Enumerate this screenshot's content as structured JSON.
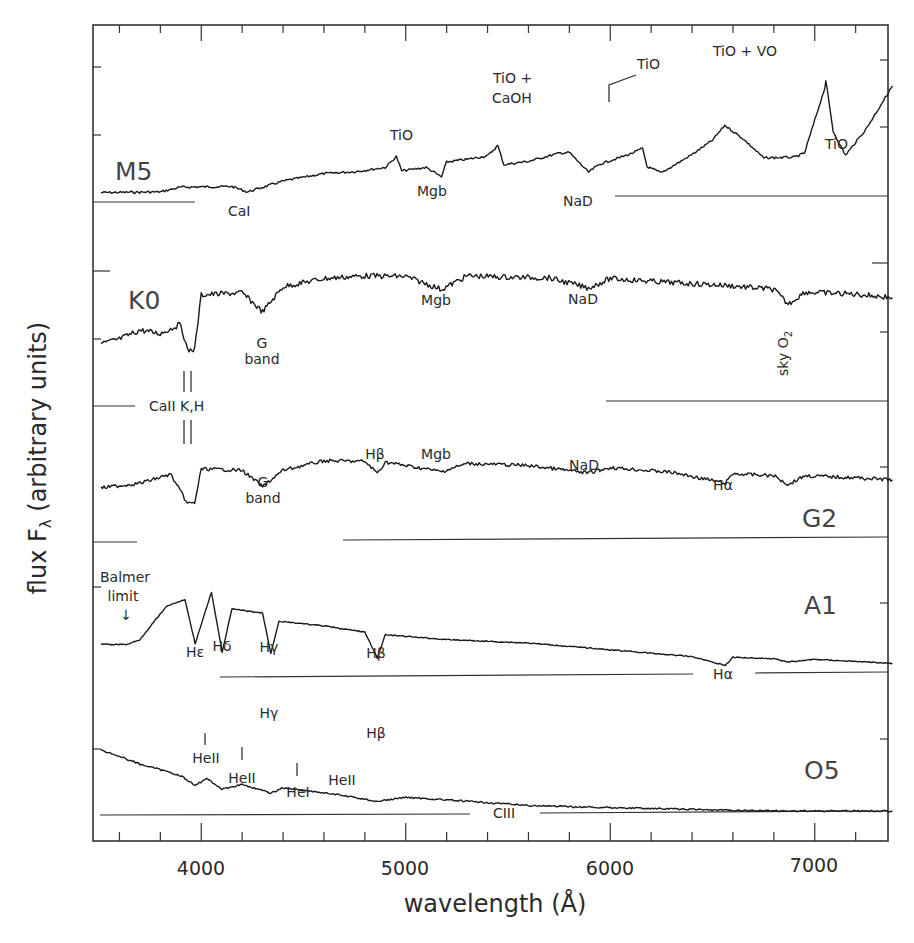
{
  "chart_data": {
    "type": "line",
    "title": "",
    "xlabel": "wavelength (Å)",
    "ylabel": "flux F_λ (arbitrary units)",
    "xlim": [
      3500,
      7380
    ],
    "x_ticks": [
      4000,
      5000,
      6000,
      7000
    ],
    "x_tick_labels": [
      "4000",
      "5000",
      "6000",
      "7000"
    ],
    "x_minor_tick_step": 200,
    "grid": false,
    "legend": "none (spectral types labelled inline)",
    "series": [
      {
        "name": "M5",
        "description": "Flux rises steeply to red; strong TiO/VO molecular bands",
        "points": [
          [
            3510,
            0.05
          ],
          [
            3800,
            0.06
          ],
          [
            3900,
            0.13
          ],
          [
            4150,
            0.14
          ],
          [
            4226,
            0.06
          ],
          [
            4400,
            0.22
          ],
          [
            4600,
            0.33
          ],
          [
            4760,
            0.36
          ],
          [
            4900,
            0.42
          ],
          [
            4954,
            0.58
          ],
          [
            4980,
            0.37
          ],
          [
            5100,
            0.42
          ],
          [
            5175,
            0.28
          ],
          [
            5200,
            0.5
          ],
          [
            5300,
            0.54
          ],
          [
            5400,
            0.59
          ],
          [
            5450,
            0.74
          ],
          [
            5480,
            0.46
          ],
          [
            5600,
            0.51
          ],
          [
            5750,
            0.63
          ],
          [
            5800,
            0.64
          ],
          [
            5893,
            0.35
          ],
          [
            5950,
            0.47
          ],
          [
            6100,
            0.62
          ],
          [
            6158,
            0.7
          ],
          [
            6180,
            0.43
          ],
          [
            6250,
            0.34
          ],
          [
            6400,
            0.61
          ],
          [
            6500,
            0.82
          ],
          [
            6560,
            1.04
          ],
          [
            6650,
            0.84
          ],
          [
            6750,
            0.56
          ],
          [
            6900,
            0.57
          ],
          [
            6950,
            0.63
          ],
          [
            7050,
            1.6
          ],
          [
            7054,
            1.7
          ],
          [
            7090,
            0.95
          ],
          [
            7150,
            0.6
          ],
          [
            7250,
            0.98
          ],
          [
            7380,
            1.62
          ]
        ]
      },
      {
        "name": "K0",
        "description": "Strong CaII K,H and G band; Mgb, NaD, telluric O2",
        "points": [
          [
            3510,
            0.9
          ],
          [
            3600,
            0.97
          ],
          [
            3700,
            1.1
          ],
          [
            3800,
            1.05
          ],
          [
            3900,
            1.19
          ],
          [
            3933,
            0.8
          ],
          [
            3968,
            0.82
          ],
          [
            4000,
            1.62
          ],
          [
            4200,
            1.65
          ],
          [
            4300,
            1.37
          ],
          [
            4400,
            1.74
          ],
          [
            4600,
            1.86
          ],
          [
            4800,
            1.9
          ],
          [
            5000,
            1.89
          ],
          [
            5175,
            1.7
          ],
          [
            5300,
            1.9
          ],
          [
            5500,
            1.88
          ],
          [
            5700,
            1.87
          ],
          [
            5893,
            1.72
          ],
          [
            6000,
            1.86
          ],
          [
            6300,
            1.8
          ],
          [
            6560,
            1.76
          ],
          [
            6800,
            1.7
          ],
          [
            6870,
            1.48
          ],
          [
            6950,
            1.66
          ],
          [
            7200,
            1.63
          ],
          [
            7380,
            1.58
          ]
        ]
      },
      {
        "name": "G2",
        "description": "Solar-type; CaII K,H, G band, Hβ, Mgb, NaD, Hα, telluric O2",
        "points": [
          [
            3510,
            0.78
          ],
          [
            3700,
            0.85
          ],
          [
            3850,
            0.98
          ],
          [
            3933,
            0.55
          ],
          [
            3968,
            0.56
          ],
          [
            4000,
            1.06
          ],
          [
            4200,
            1.04
          ],
          [
            4300,
            0.8
          ],
          [
            4400,
            1.04
          ],
          [
            4600,
            1.18
          ],
          [
            4800,
            1.17
          ],
          [
            4861,
            1.0
          ],
          [
            4900,
            1.16
          ],
          [
            5175,
            1.02
          ],
          [
            5300,
            1.14
          ],
          [
            5600,
            1.11
          ],
          [
            5893,
            1.0
          ],
          [
            6000,
            1.08
          ],
          [
            6300,
            1.01
          ],
          [
            6563,
            0.85
          ],
          [
            6600,
            0.99
          ],
          [
            6800,
            0.96
          ],
          [
            6870,
            0.83
          ],
          [
            6950,
            0.96
          ],
          [
            7200,
            0.93
          ],
          [
            7380,
            0.9
          ]
        ]
      },
      {
        "name": "A1",
        "description": "Strong Balmer series with Balmer jump",
        "points": [
          [
            3510,
            0.48
          ],
          [
            3640,
            0.48
          ],
          [
            3700,
            0.55
          ],
          [
            3760,
            0.78
          ],
          [
            3835,
            1.05
          ],
          [
            3889,
            1.1
          ],
          [
            3920,
            1.14
          ],
          [
            3970,
            0.49
          ],
          [
            4050,
            1.25
          ],
          [
            4102,
            0.36
          ],
          [
            4150,
            1.0
          ],
          [
            4300,
            0.94
          ],
          [
            4340,
            0.35
          ],
          [
            4380,
            0.82
          ],
          [
            4600,
            0.75
          ],
          [
            4800,
            0.66
          ],
          [
            4861,
            0.28
          ],
          [
            4900,
            0.62
          ],
          [
            5200,
            0.55
          ],
          [
            5600,
            0.5
          ],
          [
            6000,
            0.4
          ],
          [
            6400,
            0.3
          ],
          [
            6563,
            0.17
          ],
          [
            6600,
            0.29
          ],
          [
            6800,
            0.27
          ],
          [
            6870,
            0.22
          ],
          [
            7000,
            0.26
          ],
          [
            7380,
            0.2
          ]
        ]
      },
      {
        "name": "O5",
        "description": "Hot blue continuum; weak HeII, HeI, Balmer and CIII lines",
        "points": [
          [
            3510,
            0.96
          ],
          [
            3700,
            0.75
          ],
          [
            3900,
            0.58
          ],
          [
            3970,
            0.43
          ],
          [
            4026,
            0.54
          ],
          [
            4102,
            0.38
          ],
          [
            4200,
            0.45
          ],
          [
            4340,
            0.32
          ],
          [
            4400,
            0.4
          ],
          [
            4541,
            0.35
          ],
          [
            4686,
            0.29
          ],
          [
            4861,
            0.2
          ],
          [
            5000,
            0.26
          ],
          [
            5411,
            0.18
          ],
          [
            5600,
            0.14
          ],
          [
            5801,
            0.12
          ],
          [
            6000,
            0.11
          ],
          [
            6563,
            0.07
          ],
          [
            6870,
            0.06
          ],
          [
            7380,
            0.06
          ]
        ]
      }
    ],
    "zero_levels_px": {
      "M5": 196,
      "K0": 405,
      "G2": 541,
      "A1": 677,
      "O5": 815
    },
    "annotations": [
      {
        "series": "M5",
        "text": "CaI",
        "x": 4226
      },
      {
        "series": "M5",
        "text": "TiO",
        "x": 4954
      },
      {
        "series": "M5",
        "text": "Mgb",
        "x": 5175
      },
      {
        "series": "M5",
        "text": "TiO + CaOH",
        "x": 5550
      },
      {
        "series": "M5",
        "text": "NaD",
        "x": 5893
      },
      {
        "series": "M5",
        "text": "TiO",
        "x": 6180
      },
      {
        "series": "M5",
        "text": "TiO + VO",
        "x": 6700
      },
      {
        "series": "M5",
        "text": "TiO",
        "x": 7150
      },
      {
        "series": "K0",
        "text": "G band",
        "x": 4300
      },
      {
        "series": "K0",
        "text": "Mgb",
        "x": 5175
      },
      {
        "series": "K0",
        "text": "NaD",
        "x": 5893
      },
      {
        "series": "K0",
        "text": "sky O2",
        "x": 6870
      },
      {
        "series": "K0/G2",
        "text": "CaII K,H",
        "x": 3950
      },
      {
        "series": "G2",
        "text": "G band",
        "x": 4300
      },
      {
        "series": "G2",
        "text": "Hβ",
        "x": 4861
      },
      {
        "series": "G2",
        "text": "Mgb",
        "x": 5175
      },
      {
        "series": "G2",
        "text": "NaD",
        "x": 5893
      },
      {
        "series": "G2",
        "text": "Hα",
        "x": 6563
      },
      {
        "series": "A1",
        "text": "Balmer limit",
        "x": 3646
      },
      {
        "series": "A1",
        "text": "Hε",
        "x": 3970
      },
      {
        "series": "A1",
        "text": "Hδ",
        "x": 4102
      },
      {
        "series": "A1",
        "text": "Hγ",
        "x": 4340
      },
      {
        "series": "A1",
        "text": "Hβ",
        "x": 4861
      },
      {
        "series": "A1",
        "text": "Hα",
        "x": 6563
      },
      {
        "series": "O5",
        "text": "HeII",
        "x": 4026
      },
      {
        "series": "O5",
        "text": "HeII",
        "x": 4200
      },
      {
        "series": "O5",
        "text": "Hγ",
        "x": 4340
      },
      {
        "series": "O5",
        "text": "HeI",
        "x": 4471
      },
      {
        "series": "O5",
        "text": "HeII",
        "x": 4541
      },
      {
        "series": "O5",
        "text": "Hβ",
        "x": 4861
      },
      {
        "series": "O5",
        "text": "CIII",
        "x": 5696
      }
    ]
  },
  "labels": {
    "xlabel": "wavelength (Å)",
    "ylabel_main": "flux F",
    "ylabel_sub": "λ",
    "ylabel_rest": " (arbitrary units)",
    "xticks": [
      "4000",
      "5000",
      "6000",
      "7000"
    ],
    "types": {
      "m5": "M5",
      "k0": "K0",
      "g2": "G2",
      "a1": "A1",
      "o5": "O5"
    },
    "m5": {
      "cai": "CaI",
      "tio1": "TiO",
      "mgb": "Mgb",
      "tio_caoh_1": "TiO +",
      "tio_caoh_2": "CaOH",
      "nad": "NaD",
      "tio2": "TiO",
      "tio_vo": "TiO + VO",
      "tio3": "TiO"
    },
    "k0": {
      "g1": "G",
      "g2": "band",
      "mgb": "Mgb",
      "nad": "NaD",
      "sky": "sky O",
      "sky_sub": "2"
    },
    "caii": "CaII K,H",
    "g2": {
      "g1": "G",
      "g2": "band",
      "hbeta": "Hβ",
      "mgb": "Mgb",
      "nad": "NaD",
      "halpha": "Hα"
    },
    "a1": {
      "balmer1": "Balmer",
      "balmer2": "limit",
      "arrow": "↓",
      "heps": "Hε",
      "hdelta": "Hδ",
      "hgamma": "Hγ",
      "hbeta": "Hβ",
      "halpha": "Hα"
    },
    "o5": {
      "heii1": "HeII",
      "heii2": "HeII",
      "hgamma": "Hγ",
      "hei": "HeI",
      "heii3": "HeII",
      "hbeta": "Hβ",
      "ciii": "CIII"
    }
  }
}
